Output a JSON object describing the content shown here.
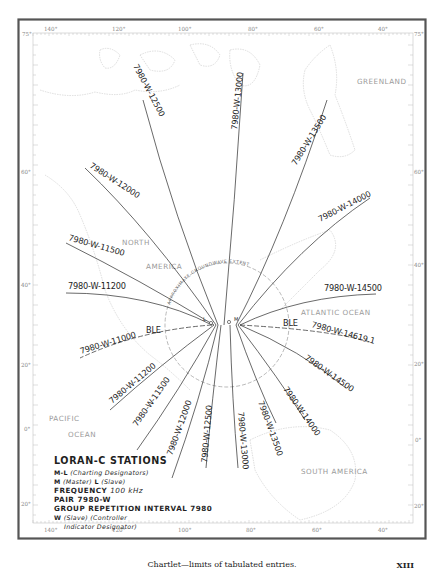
{
  "map": {
    "border_color": "#555555",
    "line_color": "#2a2a2a",
    "coast_color": "#c8c8c8",
    "top_axis": {
      "left_lat": "75°",
      "right_lat": "75°",
      "longitudes": [
        "140°",
        "120°",
        "100°",
        "80°",
        "60°",
        "40°"
      ]
    },
    "bottom_axis": {
      "longitudes": [
        "140°",
        "120°",
        "100°",
        "80°",
        "60°",
        "40°"
      ]
    },
    "left_axis": {
      "latitudes": [
        "75°",
        "60°",
        "40°",
        "20°",
        "0°",
        "20°"
      ]
    },
    "right_axis": {
      "latitudes": [
        "75°",
        "60°",
        "40°",
        "20°",
        "0°",
        "20°"
      ]
    },
    "regions": {
      "greenland": "GREENLAND",
      "north": "NORTH",
      "america": "AMERICA",
      "atlantic": "ATLANTIC OCEAN",
      "pacific": "PACIFIC",
      "ocean": "OCEAN",
      "south_america": "SOUTH AMERICA"
    },
    "extent_label": "APPROXIMATE GROUNDWAVE EXTENT",
    "stations": {
      "master": "M",
      "slave": "L"
    },
    "baseline_extension_label": "BLE",
    "lop_labels": {
      "n_12500": "7980-W-12500",
      "n_13000": "7980-W-13000",
      "n_13500": "7980-W-13500",
      "n_12000": "7980-W-12000",
      "n_14000": "7980-W-14000",
      "n_11500": "7980-W-11500",
      "n_11200": "7980-W-11200",
      "n_14500": "7980-W-14500",
      "w_11000": "7980-W-11000",
      "e_14619": "7980-W-14619.1",
      "s_11200": "7980-W-11200",
      "s_14500": "7980-W-14500",
      "s_11500": "7980-W-11500",
      "s_14000": "7980-W-14000",
      "s_12000": "7980-W-12000",
      "s_13500": "7980-W-13500",
      "s_12500": "7980-W-12500",
      "s_13000": "7980-W-13000"
    }
  },
  "legend": {
    "title": "LORAN-C STATIONS",
    "ml_code": "M-L",
    "ml_desc": "(Charting Designators)",
    "m_code": "M",
    "m_desc": "(Master)",
    "l_code": "L",
    "l_desc": "(Slave)",
    "frequency_label": "FREQUENCY",
    "frequency_value": "100 kHz",
    "pair": "PAIR 7980-W",
    "gri": "GROUP REPETITION INTERVAL 7980",
    "w_code": "W",
    "w_desc": "(Slave) (Controller",
    "w_desc2": "Indicator Designator)"
  },
  "caption": "Chartlet—limits of tabulated entries.",
  "page_number": "XIII"
}
